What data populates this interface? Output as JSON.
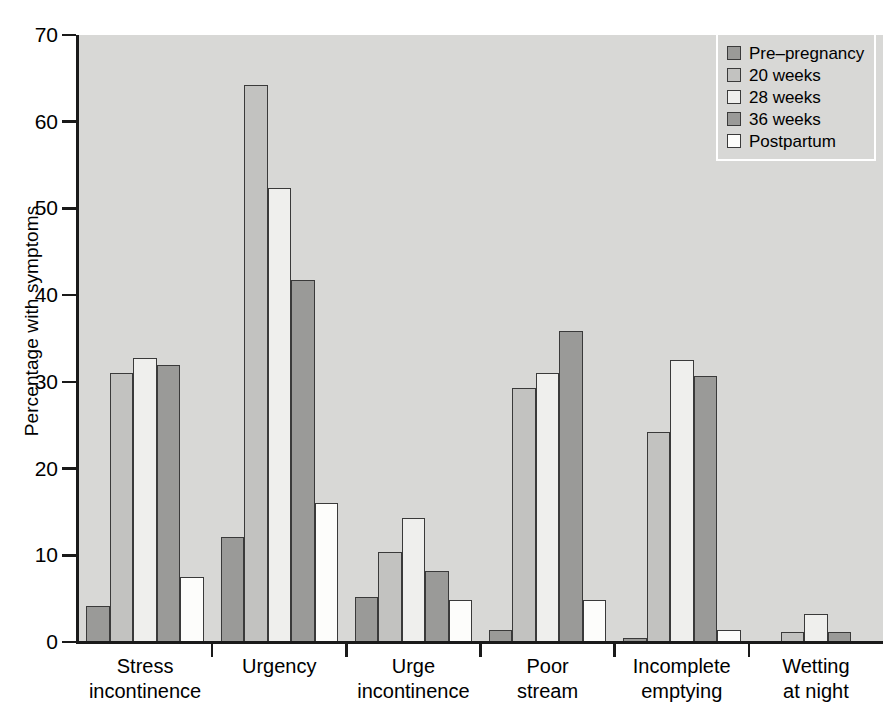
{
  "chart_data": {
    "type": "bar",
    "title": "",
    "subtitle": "",
    "xlabel": "",
    "ylabel": "Percentage with symptoms",
    "ylim": [
      0,
      70
    ],
    "ytick_values": [
      0,
      10,
      20,
      30,
      40,
      50,
      60,
      70
    ],
    "ytick_labels": [
      "0",
      "10",
      "20",
      "30",
      "40",
      "50",
      "60",
      "70"
    ],
    "grid": false,
    "legend_position": "top-right",
    "categories": [
      "Stress incontinence",
      "Urgency",
      "Urge incontinence",
      "Poor stream",
      "Incomplete emptying",
      "Wetting at night"
    ],
    "category_lines": [
      [
        "Stress",
        "incontinence"
      ],
      [
        "Urgency",
        ""
      ],
      [
        "Urge",
        "incontinence"
      ],
      [
        "Poor",
        "stream"
      ],
      [
        "Incomplete",
        "emptying"
      ],
      [
        "Wetting",
        "at night"
      ]
    ],
    "series": [
      {
        "name": "Pre-pregnancy",
        "label": "Pre–pregnancy",
        "color": "#9a9a98",
        "values": [
          4.2,
          12.1,
          5.2,
          1.4,
          0.5,
          0
        ]
      },
      {
        "name": "20 weeks",
        "label": "20 weeks",
        "color": "#c2c2c0",
        "values": [
          31.0,
          64.2,
          10.4,
          29.3,
          24.2,
          1.2
        ]
      },
      {
        "name": "28 weeks",
        "label": "28 weeks",
        "color": "#efefed",
        "values": [
          32.7,
          52.3,
          14.3,
          31.0,
          32.5,
          3.2
        ]
      },
      {
        "name": "36 weeks",
        "label": "36 weeks",
        "color": "#9a9a98",
        "values": [
          32.0,
          41.8,
          8.2,
          35.9,
          30.7,
          1.2
        ]
      },
      {
        "name": "Postpartum",
        "label": "Postpartum",
        "color": "#fdfdfb",
        "values": [
          7.5,
          16.0,
          4.9,
          4.9,
          1.4,
          0
        ]
      }
    ]
  },
  "plot": {
    "background_color": "#d8d8d6",
    "axis_color": "#1a1a1a",
    "bar_border_color": "#3a3a3a"
  },
  "legend": {
    "border_color": "#ffffff",
    "background_color": "#d8d8d6"
  }
}
